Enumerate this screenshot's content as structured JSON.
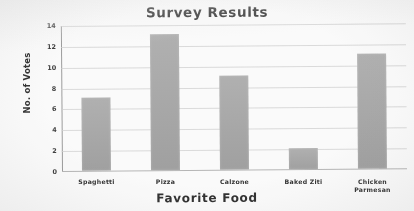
{
  "chart_data": {
    "type": "bar",
    "title": "Survey Results",
    "xlabel": "Favorite Food",
    "ylabel": "No. of Votes",
    "categories": [
      "Spaghetti",
      "Pizza",
      "Calzone",
      "Baked Ziti",
      "Chicken Parmesan"
    ],
    "category_lines": [
      [
        "Spaghetti"
      ],
      [
        "Pizza"
      ],
      [
        "Calzone"
      ],
      [
        "Baked Ziti"
      ],
      [
        "Chicken",
        "Parmesan"
      ]
    ],
    "values": [
      7,
      13,
      9,
      2,
      11
    ],
    "ylim": [
      0,
      14
    ],
    "yticks": [
      0,
      2,
      4,
      6,
      8,
      10,
      12,
      14
    ],
    "ytick_labels": [
      "0",
      "2",
      "4",
      "6",
      "8",
      "10",
      "12",
      "14"
    ],
    "grid": true,
    "legend": false,
    "bar_color": "#a6a6a6",
    "grid_color": "#cfcfcf",
    "axis_color": "#9a9a9a",
    "background_color": "#fdfdfd",
    "text_color": "#2b2b2b"
  }
}
